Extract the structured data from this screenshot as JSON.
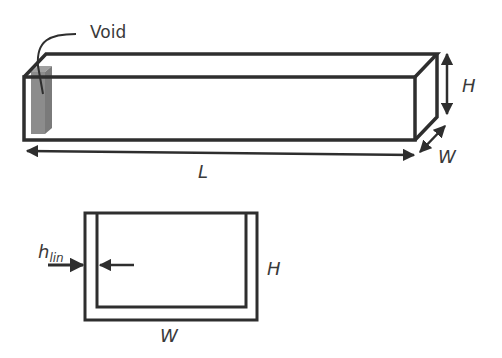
{
  "labels": {
    "void": "Void",
    "length": "L",
    "height_3d": "H",
    "width_3d": "W",
    "liner_h": "h",
    "liner_sub": "lin",
    "height_2d": "H",
    "width_2d": "W"
  },
  "colors": {
    "stroke": "#2e2e2e",
    "void_fill": "#8c8c8c",
    "background": "#ffffff"
  }
}
